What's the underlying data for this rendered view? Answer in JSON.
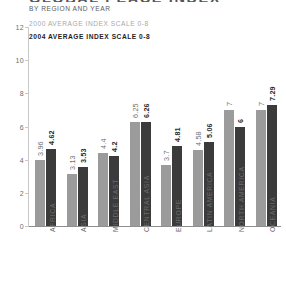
{
  "header": {
    "title": "GLOBAL PEACE INDEX",
    "subtitle": "BY REGION AND YEAR"
  },
  "legend": {
    "series_2000_label": "2000 AVERAGE INDEX SCALE 0-8",
    "series_2004_label": "2004 AVERAGE INDEX SCALE 0-8",
    "series_2000_color": "#9b9b9b",
    "series_2004_color": "#3b3b3b"
  },
  "chart_data": {
    "type": "bar",
    "title": "GLOBAL PEACE INDEX",
    "subtitle": "BY REGION AND YEAR",
    "xlabel": "",
    "ylabel": "",
    "ylim": [
      0,
      12
    ],
    "yticks": [
      0,
      2,
      4,
      6,
      8,
      10,
      12
    ],
    "ytick_labels": [
      "0",
      "2",
      "4",
      "6",
      "8",
      "10",
      "12"
    ],
    "grid": false,
    "legend_position": "top-left",
    "categories": [
      "AFRICA",
      "ASIA",
      "MIDDLE EAST",
      "CENTRAL ASIA",
      "EUROPE",
      "LATIN AMERICA",
      "NORTH AMERICA",
      "OCEANIA"
    ],
    "series": [
      {
        "name": "2000 AVERAGE INDEX SCALE 0-8",
        "color": "#9b9b9b",
        "values": [
          3.96,
          3.13,
          4.4,
          6.25,
          3.7,
          4.58,
          7,
          7
        ],
        "value_labels": [
          "3.96",
          "3.13",
          "4.4",
          "6.25",
          "3.7",
          "4.58",
          "7",
          "7"
        ]
      },
      {
        "name": "2004 AVERAGE INDEX SCALE 0-8",
        "color": "#3b3b3b",
        "values": [
          4.62,
          3.53,
          4.2,
          6.26,
          4.81,
          5.06,
          6,
          7.29
        ],
        "value_labels": [
          "4.62",
          "3.53",
          "4.2",
          "6.26",
          "4.81",
          "5.06",
          "6",
          "7.29"
        ]
      }
    ]
  }
}
